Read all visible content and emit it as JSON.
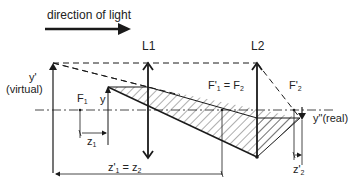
{
  "diagram": {
    "direction_label": "direction of light",
    "lenses": [
      {
        "id": "L1",
        "label": "L1",
        "x": 148
      },
      {
        "id": "L2",
        "label": "L2",
        "x": 257
      }
    ],
    "labels": {
      "y_prime": "y'",
      "virtual": "(virtual)",
      "F1": "F",
      "F1_sub": "1",
      "y": "y",
      "z1": "z",
      "z1_sub": "1",
      "F1p_eq_F2_a": "F'",
      "F1p_eq_F2_a_sub": "1",
      "F1p_eq_F2_eq": " = F",
      "F1p_eq_F2_b_sub": "2",
      "F2p": "F'",
      "F2p_sub": "2",
      "y_double_prime": "y\"",
      "real": "(real)",
      "z1p_eq_z2_a": "z'",
      "z1p_eq_z2_a_sub": "1",
      "z1p_eq_z2_eq": " = z",
      "z1p_eq_z2_b_sub": "2",
      "z2p": "z'",
      "z2p_sub": "2"
    },
    "colors": {
      "stroke": "#1a1a1a",
      "hatch": "#333333",
      "background": "#ffffff"
    }
  }
}
